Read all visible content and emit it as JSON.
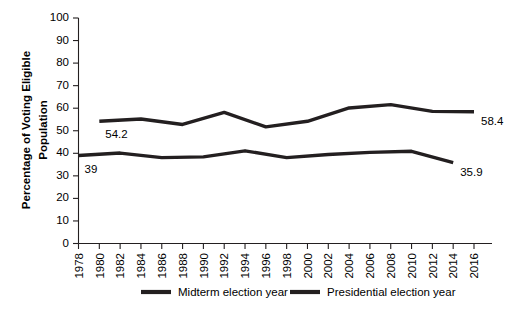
{
  "chart_data": {
    "type": "line",
    "title": "",
    "xlabel": "",
    "ylabel_line1": "Percentage of Voting Eligible",
    "ylabel_line2": "Population",
    "ylim": [
      0,
      100
    ],
    "xlim": [
      1978,
      2016
    ],
    "grid": false,
    "legend_position": "bottom",
    "ytick_labels": [
      "0",
      "10",
      "20",
      "30",
      "40",
      "50",
      "60",
      "70",
      "80",
      "90",
      "100"
    ],
    "ytick_values": [
      0,
      10,
      20,
      30,
      40,
      50,
      60,
      70,
      80,
      90,
      100
    ],
    "xtick_labels": [
      "1978",
      "1980",
      "1982",
      "1984",
      "1986",
      "1988",
      "1990",
      "1992",
      "1994",
      "1996",
      "1998",
      "2000",
      "2002",
      "2004",
      "2006",
      "2008",
      "2010",
      "2012",
      "2014",
      "2016"
    ],
    "xtick_values": [
      1978,
      1980,
      1982,
      1984,
      1986,
      1988,
      1990,
      1992,
      1994,
      1996,
      1998,
      2000,
      2002,
      2004,
      2006,
      2008,
      2010,
      2012,
      2014,
      2016
    ],
    "series": [
      {
        "name": "Midterm election year",
        "color": "#231f20",
        "x": [
          1978,
          1982,
          1986,
          1990,
          1994,
          1998,
          2002,
          2006,
          2010,
          2014
        ],
        "values": [
          39.0,
          40.1,
          38.1,
          38.4,
          41.1,
          38.1,
          39.5,
          40.4,
          40.9,
          35.9
        ]
      },
      {
        "name": "Presidential election year",
        "color": "#231f20",
        "x": [
          1980,
          1984,
          1988,
          1992,
          1996,
          2000,
          2004,
          2008,
          2012,
          2016
        ],
        "values": [
          54.2,
          55.2,
          52.8,
          58.1,
          51.7,
          54.2,
          60.1,
          61.6,
          58.6,
          58.4
        ]
      }
    ],
    "annotations": [
      {
        "text": "54.2",
        "series": "Presidential election year",
        "x": 1980,
        "value": 54.2
      },
      {
        "text": "39",
        "series": "Midterm election year",
        "x": 1978,
        "value": 39.0
      },
      {
        "text": "58.4",
        "series": "Presidential election year",
        "x": 2016,
        "value": 58.4
      },
      {
        "text": "35.9",
        "series": "Midterm election year",
        "x": 2014,
        "value": 35.9
      }
    ]
  },
  "legend": {
    "items": [
      {
        "label": "Midterm election year"
      },
      {
        "label": "Presidential election year"
      }
    ]
  }
}
